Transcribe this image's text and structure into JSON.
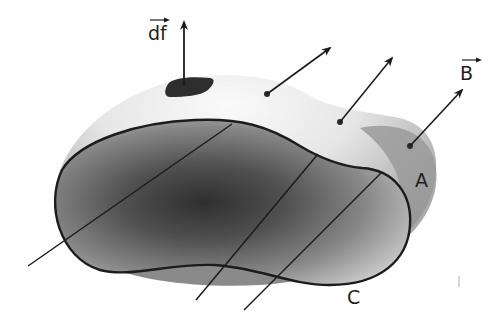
{
  "diagram": {
    "type": "physics-surface-flux",
    "labels": {
      "df": "df",
      "B": "B",
      "A": "A",
      "C": "C"
    },
    "elements": {
      "surface": {
        "name": "A",
        "description": "curved surface spanning boundary curve"
      },
      "boundary": {
        "name": "C",
        "description": "closed boundary curve of surface A"
      },
      "surface_element": {
        "name": "df",
        "description": "small surface patch with normal vector arrow"
      },
      "field_lines": {
        "name": "B",
        "count": 3,
        "description": "field vectors piercing the surface"
      }
    },
    "colors": {
      "outline": "#1c1c1c",
      "surface_light": "#f2f2f2",
      "surface_mid": "#9a9a9a",
      "surface_dark": "#3a3a3a",
      "patch": "#2e2e2e",
      "text": "#1e1e1e"
    }
  }
}
